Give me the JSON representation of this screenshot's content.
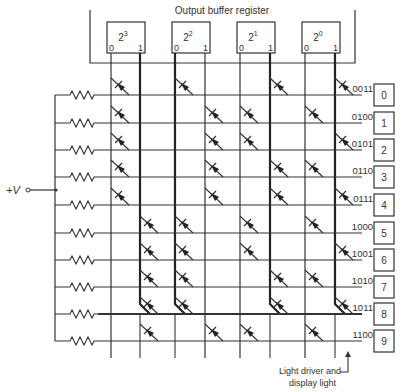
{
  "title": "Output buffer register",
  "supply_label": "+V",
  "footnote": [
    "Light driver and",
    "display light"
  ],
  "register_bits": [
    {
      "base": "2",
      "exp": "3",
      "zero": "0",
      "one": "1"
    },
    {
      "base": "2",
      "exp": "2",
      "zero": "0",
      "one": "1"
    },
    {
      "base": "2",
      "exp": "1",
      "zero": "0",
      "one": "1"
    },
    {
      "base": "2",
      "exp": "0",
      "zero": "0",
      "one": "1"
    }
  ],
  "rows": [
    {
      "code": "0011",
      "digit": "0"
    },
    {
      "code": "0100",
      "digit": "1"
    },
    {
      "code": "0101",
      "digit": "2"
    },
    {
      "code": "0110",
      "digit": "3"
    },
    {
      "code": "0111",
      "digit": "4"
    },
    {
      "code": "1000",
      "digit": "5"
    },
    {
      "code": "1001",
      "digit": "6"
    },
    {
      "code": "1010",
      "digit": "7"
    },
    {
      "code": "1011",
      "digit": "8"
    },
    {
      "code": "1100",
      "digit": "9"
    }
  ],
  "highlighted_row": 8,
  "colors": {
    "line": "#333333",
    "background": "#ffffff"
  }
}
